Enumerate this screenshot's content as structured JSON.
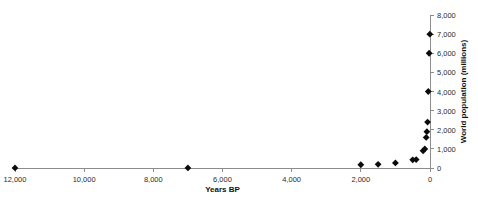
{
  "chart_data": {
    "type": "scatter",
    "title": "",
    "xlabel": "Years BP",
    "ylabel": "World population (millions)",
    "xlim": [
      12000,
      0
    ],
    "ylim": [
      0,
      8000
    ],
    "x_reversed": true,
    "grid": false,
    "legend": null,
    "marker": "diamond",
    "marker_color": "#0b0b0b",
    "axis_color": "#8c8c8c",
    "xticks": [
      12000,
      10000,
      8000,
      6000,
      4000,
      2000,
      0
    ],
    "xtick_labels": [
      "12,000",
      "10,000",
      "8,000",
      "6,000",
      "4,000",
      "2,000",
      "0"
    ],
    "yticks": [
      0,
      1000,
      2000,
      3000,
      4000,
      5000,
      6000,
      7000,
      8000
    ],
    "ytick_labels": [
      "0",
      "1,000",
      "2,000",
      "3,000",
      "4,000",
      "5,000",
      "6,000",
      "7,000",
      "8,000"
    ],
    "y_axis_side": "right",
    "points": [
      {
        "x": 12000,
        "y": 4
      },
      {
        "x": 7000,
        "y": 5
      },
      {
        "x": 2000,
        "y": 170
      },
      {
        "x": 1500,
        "y": 190
      },
      {
        "x": 1000,
        "y": 265
      },
      {
        "x": 500,
        "y": 425
      },
      {
        "x": 400,
        "y": 440
      },
      {
        "x": 200,
        "y": 900
      },
      {
        "x": 150,
        "y": 1000
      },
      {
        "x": 110,
        "y": 1600
      },
      {
        "x": 90,
        "y": 1900
      },
      {
        "x": 70,
        "y": 2400
      },
      {
        "x": 50,
        "y": 4000
      },
      {
        "x": 25,
        "y": 6000
      },
      {
        "x": 5,
        "y": 7000
      }
    ]
  },
  "xaxis": {
    "title": "Years BP"
  },
  "yaxis": {
    "title": "World population (millions)"
  }
}
